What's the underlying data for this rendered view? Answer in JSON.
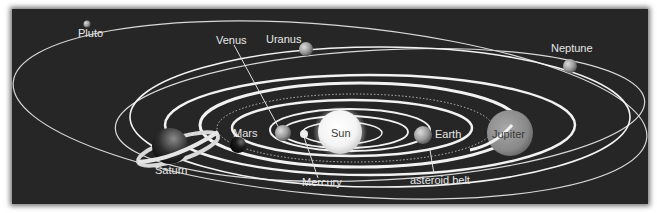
{
  "diagram": {
    "background_color": "#262626",
    "orbit_color": "#f2f2f2",
    "bodies": [
      {
        "name": "Sun",
        "label": "Sun"
      },
      {
        "name": "Mercury",
        "label": "Mercury"
      },
      {
        "name": "Venus",
        "label": "Venus"
      },
      {
        "name": "Earth",
        "label": "Earth"
      },
      {
        "name": "Mars",
        "label": "Mars"
      },
      {
        "name": "Jupiter",
        "label": "Jupiter"
      },
      {
        "name": "Saturn",
        "label": "Saturn"
      },
      {
        "name": "Uranus",
        "label": "Uranus"
      },
      {
        "name": "Neptune",
        "label": "Neptune"
      },
      {
        "name": "Pluto",
        "label": "Pluto"
      }
    ],
    "annotations": [
      {
        "name": "asteroid-belt",
        "label": "asteroid belt"
      }
    ]
  }
}
